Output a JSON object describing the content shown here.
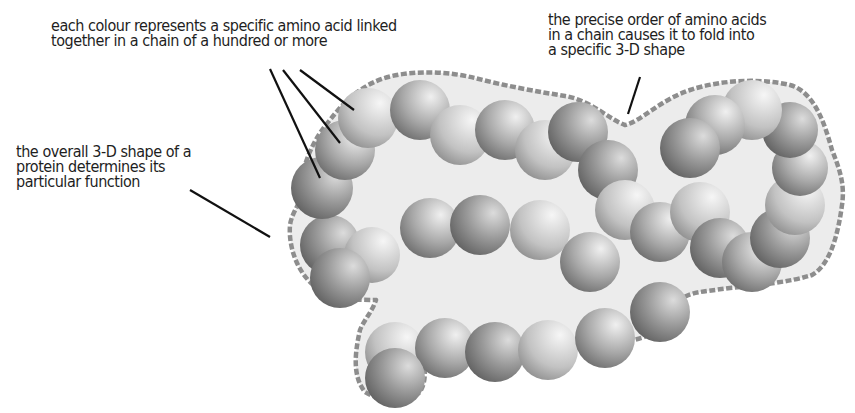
{
  "diagram": {
    "labels": {
      "colour": "each colour represents a specific amino acid linked\ntogether in a chain of a hundred or more",
      "order": "the precise order of amino acids\nin a chain causes it to fold into\na specific 3-D shape",
      "shape": "the overall 3-D shape of a\nprotein determines its\nparticular function"
    },
    "colors": {
      "outline": "#8a8a8a",
      "fill": "#ececec",
      "sphere_dark": "#6e6e6e",
      "sphere_light": "#f2f2f2",
      "leader": "#111111",
      "text": "#1e1e1e"
    }
  }
}
